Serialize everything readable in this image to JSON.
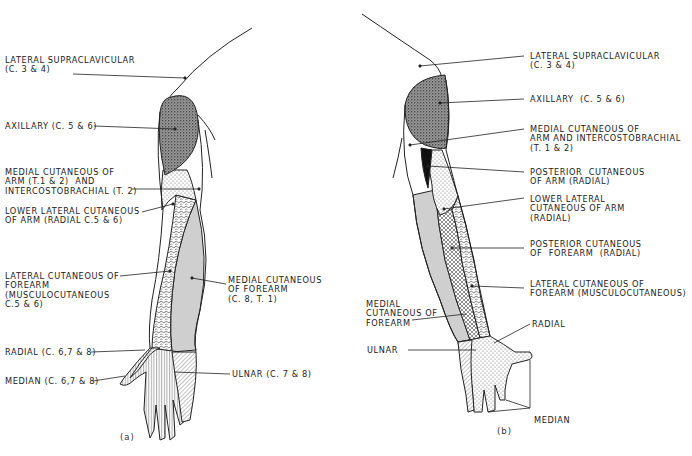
{
  "figure_a": {
    "caption": "(a)",
    "labels": {
      "lateral_supraclavicular": "LATERAL SUPRACLAVICULAR\n(C. 3 & 4)",
      "axillary": "AXILLARY (C. 5 & 6)",
      "medial_cutaneous_arm": "MEDIAL CUTANEOUS OF\nARM (T.1 & 2)  AND\nINTERCOSTOBRACHIAL (T. 2)",
      "lower_lateral_cutaneous": "LOWER LATERAL CUTANEOUS\nOF ARM (RADIAL C.5 & 6)",
      "lateral_cutaneous_forearm": "LATERAL CUTANEOUS OF\nFOREARM\n(MUSCULOCUTANEOUS\nC.5 & 6)",
      "medial_cutaneous_forearm": "MEDIAL CUTANEOUS\nOF FOREARM\n(C. 8, T. 1)",
      "radial": "RADIAL (C. 6,7 & 8)",
      "median": "MEDIAN (C. 6,7 & 8)",
      "ulnar": "ULNAR (C. 7 & 8)"
    }
  },
  "figure_b": {
    "caption": "(b)",
    "labels": {
      "lateral_supraclavicular": "LATERAL SUPRACLAVICULAR\n(C. 3 & 4)",
      "axillary": "AXILLARY  (C. 5 & 6)",
      "medial_cutaneous_arm": "MEDIAL CUTANEOUS OF\nARM AND INTERCOSTOBRACHIAL\n(T. 1 & 2)",
      "posterior_cutaneous_arm": "POSTERIOR  CUTANEOUS\nOF ARM (RADIAL)",
      "lower_lateral_cutaneous": "LOWER LATERAL\nCUTANEOUS OF ARM\n(RADIAL)",
      "posterior_cutaneous_forearm": "POSTERIOR CUTANEOUS\nOF  FOREARM  (RADIAL)",
      "lateral_cutaneous_forearm": "LATERAL CUTANEOUS OF\nFOREARM (MUSCULOCUTANEOUS)",
      "medial_cutaneous_forearm": "MEDIAL\nCUTANEOUS OF\nFOREARM",
      "radial": "RADIAL",
      "ulnar": "ULNAR",
      "median": "MEDIAN"
    }
  }
}
